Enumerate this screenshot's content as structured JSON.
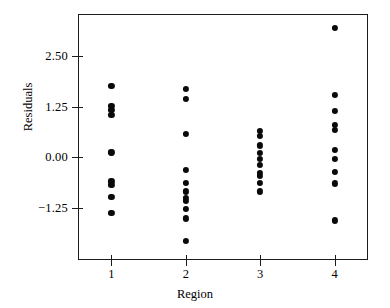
{
  "chart_data": {
    "type": "scatter",
    "title": "",
    "xlabel": "Region",
    "ylabel": "Residuals",
    "xlim": [
      0.55,
      4.45
    ],
    "ylim": [
      -2.55,
      3.55
    ],
    "grid": false,
    "legend": "none",
    "xticks": [
      "1",
      "2",
      "3",
      "4"
    ],
    "xtick_values": [
      1,
      2,
      3,
      4
    ],
    "yticks": [
      "2.50",
      "1.25",
      "0.00",
      "−1.25"
    ],
    "ytick_values": [
      2.5,
      1.25,
      0.0,
      -1.25
    ],
    "marker": "filled-circle",
    "marker_color": "#0a0a0a",
    "series": [
      {
        "name": "Region 1",
        "x": 1,
        "values": [
          1.77,
          1.27,
          1.18,
          1.04,
          0.12,
          -0.6,
          -0.68,
          -0.99,
          -1.38
        ]
      },
      {
        "name": "Region 2",
        "x": 2,
        "values": [
          1.69,
          1.45,
          0.58,
          -0.31,
          -0.63,
          -0.85,
          -1.02,
          -1.09,
          -1.28,
          -1.52,
          -2.08
        ]
      },
      {
        "name": "Region 3",
        "x": 3,
        "values": [
          0.65,
          0.53,
          0.29,
          0.1,
          -0.05,
          -0.19,
          -0.39,
          -0.46,
          -0.63,
          -0.85
        ]
      },
      {
        "name": "Region 4",
        "x": 4,
        "values": [
          3.21,
          1.55,
          1.14,
          0.8,
          0.68,
          0.19,
          -0.05,
          -0.36,
          -0.65,
          -1.57
        ]
      }
    ]
  }
}
